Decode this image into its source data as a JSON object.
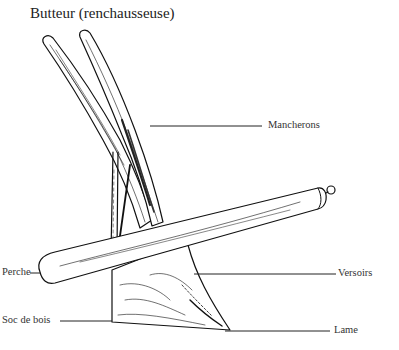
{
  "diagram": {
    "title": "Butteur (renchausseuse)",
    "labels": {
      "mancherons": "Mancherons",
      "perche": "Perche",
      "versoirs": "Versoirs",
      "soc_de_bois": "Soc de bois",
      "lame": "Lame"
    }
  }
}
